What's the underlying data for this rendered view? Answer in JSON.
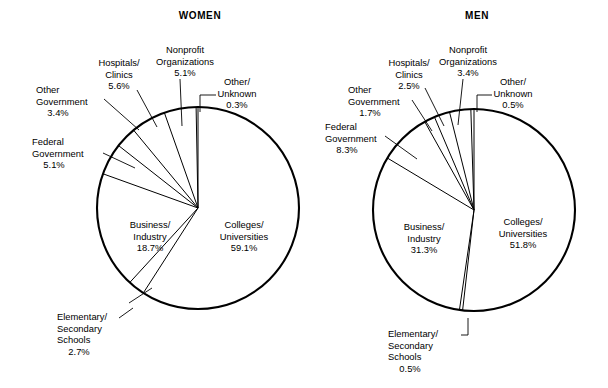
{
  "figure": {
    "background_color": "#ffffff",
    "ink_color": "#000000",
    "width": 608,
    "height": 388
  },
  "charts": [
    {
      "id": "women",
      "title": "WOMEN",
      "title_x": 200,
      "title_y": 19,
      "center_x": 198,
      "center_y": 208,
      "radius": 101,
      "slices": [
        {
          "key": "colleges-universities",
          "name": "Colleges/",
          "name2": "Universities",
          "value": 59.1,
          "value_label": "59.1%",
          "label_x": 244,
          "label_y": 228,
          "label_anchor": "middle",
          "label_placement": "inside",
          "leader": null
        },
        {
          "key": "elementary-secondary-schools",
          "name": "Elementary/",
          "name2": "Secondary",
          "name3": "Schools",
          "value": 2.7,
          "value_label": "2.7%",
          "label_x": 57,
          "label_y": 320,
          "label_anchor": "start",
          "label_placement": "outside",
          "leader": "M 119,318 L 133,308 M 129,303 L 152,288"
        },
        {
          "key": "business-industry",
          "name": "Business/",
          "name2": "Industry",
          "value": 18.7,
          "value_label": "18.7%",
          "label_x": 150,
          "label_y": 228,
          "label_anchor": "middle",
          "label_placement": "inside",
          "leader": null
        },
        {
          "key": "federal-government",
          "name": "Federal",
          "name2": "Government",
          "value": 5.1,
          "value_label": "5.1%",
          "label_x": 32,
          "label_y": 145,
          "label_anchor": "start",
          "label_placement": "outside",
          "leader": "M 103,153 L 135,168"
        },
        {
          "key": "other-government",
          "name": "Other",
          "name2": "Government",
          "value": 3.4,
          "value_label": "3.4%",
          "label_x": 36,
          "label_y": 93,
          "label_anchor": "start",
          "label_placement": "outside",
          "leader": "M 104,99 L 139,130"
        },
        {
          "key": "hospitals-clinics",
          "name": "Hospitals/",
          "name2": "Clinics",
          "value": 5.6,
          "value_label": "5.6%",
          "label_x": 119,
          "label_y": 66,
          "label_anchor": "middle",
          "label_placement": "outside",
          "leader": "M 137,90 L 157,127"
        },
        {
          "key": "nonprofit-organizations",
          "name": "Nonprofit",
          "name2": "Organizations",
          "value": 5.1,
          "value_label": "5.1%",
          "label_x": 185,
          "label_y": 53,
          "label_anchor": "middle",
          "label_placement": "outside",
          "leader": "M 180,79 L 182,126"
        },
        {
          "key": "other-unknown",
          "name": "Other/",
          "name2": "Unknown",
          "value": 0.3,
          "value_label": "0.3%",
          "label_x": 237,
          "label_y": 85,
          "label_anchor": "middle",
          "label_placement": "outside",
          "leader": "M 216,95 L 200,95 L 200,112"
        }
      ]
    },
    {
      "id": "men",
      "title": "MEN",
      "title_x": 477,
      "title_y": 19,
      "center_x": 474,
      "center_y": 210,
      "radius": 101,
      "slices": [
        {
          "key": "colleges-universities",
          "name": "Colleges/",
          "name2": "Universities",
          "value": 51.8,
          "value_label": "51.8%",
          "label_x": 523,
          "label_y": 225,
          "label_anchor": "middle",
          "label_placement": "inside",
          "leader": null
        },
        {
          "key": "elementary-secondary-schools",
          "name": "Elementary/",
          "name2": "Secondary",
          "name3": "Schools",
          "value": 0.5,
          "value_label": "0.5%",
          "label_x": 388,
          "label_y": 337,
          "label_anchor": "start",
          "label_placement": "outside",
          "leader": "M 461,335 L 468,335 L 468,318"
        },
        {
          "key": "business-industry",
          "name": "Business/",
          "name2": "Industry",
          "value": 31.3,
          "value_label": "31.3%",
          "label_x": 424,
          "label_y": 230,
          "label_anchor": "middle",
          "label_placement": "inside",
          "leader": null
        },
        {
          "key": "federal-government",
          "name": "Federal",
          "name2": "Government",
          "value": 8.3,
          "value_label": "8.3%",
          "label_x": 325,
          "label_y": 130,
          "label_anchor": "start",
          "label_placement": "outside",
          "leader": "M 385,136 L 417,159"
        },
        {
          "key": "other-government",
          "name": "Other",
          "name2": "Government",
          "value": 1.7,
          "value_label": "1.7%",
          "label_x": 348,
          "label_y": 93,
          "label_anchor": "start",
          "label_placement": "outside",
          "leader": "M 412,100 L 432,131"
        },
        {
          "key": "hospitals-clinics",
          "name": "Hospitals/",
          "name2": "Clinics",
          "value": 2.5,
          "value_label": "2.5%",
          "label_x": 409,
          "label_y": 66,
          "label_anchor": "middle",
          "label_placement": "outside",
          "leader": "M 425,88 L 444,126"
        },
        {
          "key": "nonprofit-organizations",
          "name": "Nonprofit",
          "name2": "Organizations",
          "value": 3.4,
          "value_label": "3.4%",
          "label_x": 468,
          "label_y": 53,
          "label_anchor": "middle",
          "label_placement": "outside",
          "leader": "M 463,79 L 458,125"
        },
        {
          "key": "other-unknown",
          "name": "Other/",
          "name2": "Unknown",
          "value": 0.5,
          "value_label": "0.5%",
          "label_x": 513,
          "label_y": 85,
          "label_anchor": "middle",
          "label_placement": "outside",
          "leader": "M 492,95 L 477,95 L 477,112"
        }
      ]
    }
  ],
  "chart_data": {
    "type": "pie",
    "charts": [
      {
        "title": "WOMEN",
        "labels": [
          "Colleges/Universities",
          "Elementary/Secondary Schools",
          "Business/Industry",
          "Federal Government",
          "Other Government",
          "Hospitals/Clinics",
          "Nonprofit Organizations",
          "Other/Unknown"
        ],
        "values": [
          59.1,
          2.7,
          18.7,
          5.1,
          3.4,
          5.6,
          5.1,
          0.3
        ],
        "units": "percent",
        "total": 100.0,
        "start_angle_deg": 270,
        "direction": "clockwise"
      },
      {
        "title": "MEN",
        "labels": [
          "Colleges/Universities",
          "Elementary/Secondary Schools",
          "Business/Industry",
          "Federal Government",
          "Other Government",
          "Hospitals/Clinics",
          "Nonprofit Organizations",
          "Other/Unknown"
        ],
        "values": [
          51.8,
          0.5,
          31.3,
          8.3,
          1.7,
          2.5,
          3.4,
          0.5
        ],
        "units": "percent",
        "total": 100.0,
        "start_angle_deg": 270,
        "direction": "clockwise"
      }
    ],
    "legend": "none",
    "grid": false
  }
}
